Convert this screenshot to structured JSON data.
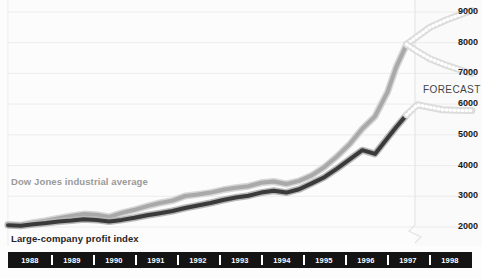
{
  "chart_data": {
    "type": "line",
    "title": "",
    "xlabel": "",
    "ylabel": "",
    "ylim": [
      1500,
      9400
    ],
    "xlim": [
      1988,
      1999
    ],
    "grid": true,
    "legend_position": "inline-annotations",
    "y_ticks": [
      9000,
      8000,
      7000,
      6000,
      5000,
      4000,
      3000,
      2000
    ],
    "y_tick_labels": [
      "9000",
      "8000",
      "7000",
      "6000",
      "5000",
      "4000",
      "3000",
      "2000"
    ],
    "categories": [
      "1988",
      "1989",
      "1990",
      "1991",
      "1992",
      "1993",
      "1994",
      "1995",
      "1996",
      "1997",
      "1998"
    ],
    "annotations": [
      {
        "text": "FORECAST",
        "x": 1997.6,
        "y": 6400
      },
      {
        "text": "Dow Jones industrial average",
        "x": 1988.2,
        "y": 3050
      },
      {
        "text": "Large-company profit index",
        "x": 1988.2,
        "y": 1750
      }
    ],
    "forecast_divider_x": 1997.45,
    "series": [
      {
        "name": "Dow Jones industrial average",
        "color": "#a9a9a9",
        "style": "solid",
        "x": [
          1988.0,
          1988.3,
          1988.6,
          1988.9,
          1989.2,
          1989.5,
          1989.8,
          1990.1,
          1990.4,
          1990.7,
          1991.0,
          1991.3,
          1991.6,
          1991.9,
          1992.2,
          1992.5,
          1992.8,
          1993.1,
          1993.4,
          1993.7,
          1994.0,
          1994.3,
          1994.6,
          1994.9,
          1995.2,
          1995.5,
          1995.8,
          1996.1,
          1996.4,
          1996.7,
          1997.0,
          1997.2,
          1997.45
        ],
        "values": [
          2080,
          2060,
          2140,
          2210,
          2290,
          2360,
          2420,
          2400,
          2330,
          2460,
          2560,
          2680,
          2780,
          2860,
          3010,
          3060,
          3120,
          3210,
          3280,
          3330,
          3440,
          3480,
          3400,
          3500,
          3680,
          3950,
          4300,
          4700,
          5200,
          5600,
          6400,
          7200,
          7950
        ]
      },
      {
        "name": "Large-company profit index",
        "color": "#3a3a3a",
        "style": "solid",
        "x": [
          1988.0,
          1988.3,
          1988.6,
          1988.9,
          1989.2,
          1989.5,
          1989.8,
          1990.1,
          1990.4,
          1990.7,
          1991.0,
          1991.3,
          1991.6,
          1991.9,
          1992.2,
          1992.5,
          1992.8,
          1993.1,
          1993.4,
          1993.7,
          1994.0,
          1994.3,
          1994.6,
          1994.9,
          1995.2,
          1995.5,
          1995.8,
          1996.1,
          1996.4,
          1996.7,
          1997.0,
          1997.2,
          1997.45
        ],
        "values": [
          2060,
          2040,
          2090,
          2130,
          2180,
          2210,
          2250,
          2230,
          2180,
          2230,
          2300,
          2380,
          2450,
          2520,
          2620,
          2700,
          2780,
          2880,
          2960,
          3020,
          3120,
          3180,
          3120,
          3230,
          3420,
          3620,
          3900,
          4200,
          4500,
          4380,
          4900,
          5250,
          5650
        ]
      },
      {
        "name": "Dow Jones forecast upper",
        "color": "#c9c9c9",
        "style": "dotted",
        "x": [
          1997.45,
          1997.7,
          1998.0,
          1998.4,
          1998.8,
          1999.0
        ],
        "values": [
          7950,
          8200,
          8500,
          8750,
          8950,
          9050
        ]
      },
      {
        "name": "Dow Jones forecast lower",
        "color": "#c9c9c9",
        "style": "dotted",
        "x": [
          1997.45,
          1997.7,
          1998.0,
          1998.4,
          1998.8,
          1999.0
        ],
        "values": [
          7950,
          7720,
          7480,
          7260,
          7080,
          7000
        ]
      },
      {
        "name": "Large-company profit index forecast",
        "color": "#c9c9c9",
        "style": "dotted",
        "x": [
          1997.45,
          1997.7,
          1998.0,
          1998.3,
          1998.6,
          1999.0
        ],
        "values": [
          5650,
          5980,
          5900,
          5820,
          5800,
          5790
        ]
      }
    ]
  },
  "axis": {
    "y_labels": [
      "9000",
      "8000",
      "7000",
      "6000",
      "5000",
      "4000",
      "3000",
      "2000"
    ],
    "x_labels": [
      "1988",
      "1989",
      "1990",
      "1991",
      "1992",
      "1993",
      "1994",
      "1995",
      "1996",
      "1997",
      "1998"
    ]
  },
  "labels": {
    "forecast": "FORECAST",
    "dow": "Dow Jones industrial average",
    "profit": "Large-company profit index"
  },
  "colors": {
    "dow_line": "#a9a9a9",
    "profit_line": "#3a3a3a",
    "forecast_dot": "#c9c9c9",
    "axis_bar": "#141414",
    "grid": "#ececec"
  }
}
